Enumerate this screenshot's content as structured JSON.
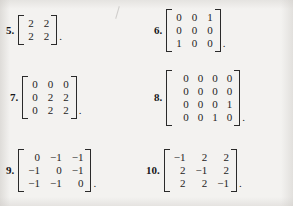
{
  "page": {
    "background_color": "#f3f2f0",
    "ink_color": "#232323"
  },
  "artifact": {
    "name": "scan-pencil-mark"
  },
  "exercises": [
    {
      "number": "5.",
      "trailing": ".",
      "rows": [
        [
          "2",
          "2"
        ],
        [
          "2",
          "2"
        ]
      ]
    },
    {
      "number": "6.",
      "trailing": ".",
      "rows": [
        [
          "0",
          "0",
          "1"
        ],
        [
          "0",
          "0",
          "0"
        ],
        [
          "1",
          "0",
          "0"
        ]
      ]
    },
    {
      "number": "7.",
      "trailing": ".",
      "rows": [
        [
          "0",
          "0",
          "0"
        ],
        [
          "0",
          "2",
          "2"
        ],
        [
          "0",
          "2",
          "2"
        ]
      ]
    },
    {
      "number": "8.",
      "trailing": ".",
      "rows": [
        [
          "0",
          "0",
          "0",
          "0"
        ],
        [
          "0",
          "0",
          "0",
          "0"
        ],
        [
          "0",
          "0",
          "0",
          "1"
        ],
        [
          "0",
          "0",
          "1",
          "0"
        ]
      ]
    },
    {
      "number": "9.",
      "trailing": ".",
      "rows": [
        [
          "0",
          "−1",
          "−1"
        ],
        [
          "−1",
          "0",
          "−1"
        ],
        [
          "−1",
          "−1",
          "0"
        ]
      ]
    },
    {
      "number": "10.",
      "trailing": ".",
      "rows": [
        [
          "−1",
          "2",
          "2"
        ],
        [
          "2",
          "−1",
          "2"
        ],
        [
          "2",
          "2",
          "−1"
        ]
      ]
    }
  ]
}
